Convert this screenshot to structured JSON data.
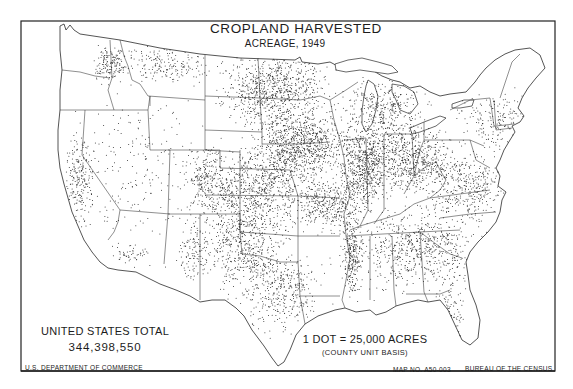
{
  "map": {
    "title": "CROPLAND HARVESTED",
    "subtitle": "ACREAGE, 1949",
    "total_label": "UNITED STATES TOTAL",
    "total_value": "344,398,550",
    "scale_label": "1 DOT = 25,000 ACRES",
    "scale_basis": "(COUNTY UNIT BASIS)",
    "department": "U.S. DEPARTMENT OF COMMERCE",
    "map_number": "MAP NO. A50-003",
    "bureau": "BUREAU OF THE CENSUS",
    "colors": {
      "ink": "#1c1c1c",
      "paper": "#ffffff"
    },
    "density_regions": [
      {
        "name": "corn-belt-iowa",
        "cx": 300,
        "cy": 145,
        "rx": 40,
        "ry": 30,
        "n": 900
      },
      {
        "name": "illinois",
        "cx": 365,
        "cy": 165,
        "rx": 22,
        "ry": 38,
        "n": 650
      },
      {
        "name": "indiana-ohio",
        "cx": 410,
        "cy": 160,
        "rx": 35,
        "ry": 28,
        "n": 600
      },
      {
        "name": "minnesota-dakotas",
        "cx": 275,
        "cy": 90,
        "rx": 45,
        "ry": 32,
        "n": 800
      },
      {
        "name": "nebraska-kansas",
        "cx": 255,
        "cy": 190,
        "rx": 55,
        "ry": 35,
        "n": 850
      },
      {
        "name": "oklahoma-texas-plains",
        "cx": 245,
        "cy": 245,
        "rx": 35,
        "ry": 35,
        "n": 500
      },
      {
        "name": "missouri",
        "cx": 330,
        "cy": 205,
        "rx": 30,
        "ry": 22,
        "n": 350
      },
      {
        "name": "wisconsin-michigan",
        "cx": 385,
        "cy": 110,
        "rx": 35,
        "ry": 25,
        "n": 330
      },
      {
        "name": "mississippi-delta",
        "cx": 352,
        "cy": 255,
        "rx": 8,
        "ry": 35,
        "n": 260
      },
      {
        "name": "southeast",
        "cx": 420,
        "cy": 250,
        "rx": 55,
        "ry": 35,
        "n": 650
      },
      {
        "name": "texas-east",
        "cx": 280,
        "cy": 290,
        "rx": 35,
        "ry": 35,
        "n": 380
      },
      {
        "name": "mid-atlantic",
        "cx": 470,
        "cy": 185,
        "rx": 40,
        "ry": 30,
        "n": 400
      },
      {
        "name": "northeast",
        "cx": 500,
        "cy": 120,
        "rx": 35,
        "ry": 25,
        "n": 200
      },
      {
        "name": "montana-north",
        "cx": 165,
        "cy": 65,
        "rx": 45,
        "ry": 15,
        "n": 200
      },
      {
        "name": "palouse",
        "cx": 110,
        "cy": 65,
        "rx": 15,
        "ry": 15,
        "n": 150
      },
      {
        "name": "california-valley",
        "cx": 80,
        "cy": 180,
        "rx": 12,
        "ry": 40,
        "n": 220
      },
      {
        "name": "colorado-east",
        "cx": 205,
        "cy": 175,
        "rx": 18,
        "ry": 25,
        "n": 160
      },
      {
        "name": "mountain-sparse",
        "cx": 135,
        "cy": 170,
        "rx": 50,
        "ry": 70,
        "n": 180
      },
      {
        "name": "arizona",
        "cx": 130,
        "cy": 255,
        "rx": 15,
        "ry": 10,
        "n": 50
      },
      {
        "name": "new-mexico-east",
        "cx": 195,
        "cy": 250,
        "rx": 15,
        "ry": 25,
        "n": 120
      },
      {
        "name": "florida",
        "cx": 450,
        "cy": 315,
        "rx": 12,
        "ry": 35,
        "n": 130
      }
    ]
  }
}
